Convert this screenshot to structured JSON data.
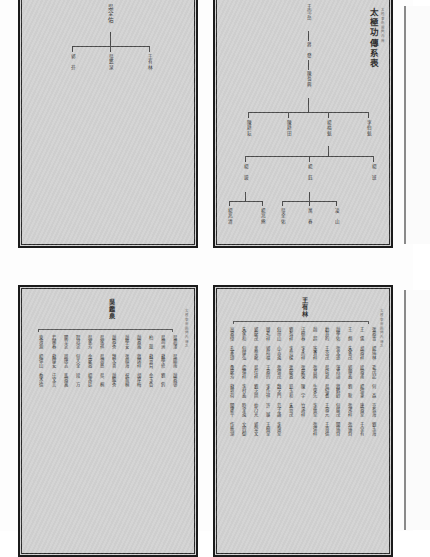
{
  "page": {
    "kind": "scanned-genealogy-book-spread",
    "paper_color": "#d2d2d2",
    "ink_color": "#3a3a3a",
    "background_color": "#fdfdfd"
  },
  "leaves": {
    "top_left": {
      "name": "top-left-leaf",
      "banxin": "",
      "tree": {
        "root": "吳全佑",
        "children": [
          "王有林",
          "吳鑑泉",
          "郭\n芬"
        ]
      }
    },
    "top_right": {
      "name": "top-right-leaf",
      "title": "太極功傳系表",
      "banxin": "太極拳術圖門內傳",
      "generations": [
        {
          "nodes": [
            "王宗岳"
          ]
        },
        {
          "nodes": [
            "蔣　發"
          ]
        },
        {
          "nodes": [
            "陳長興"
          ]
        },
        {
          "nodes": [
            "陳耕耘",
            "陳耕田",
            "楊福魁",
            "李伯魁"
          ]
        },
        {
          "nodes": [
            "楊\n鋑",
            "楊\n鈺",
            "楊\n班"
          ]
        },
        {
          "nodes": [
            "楊兆熊",
            "楊兆清",
            "吳全佑",
            "萬\n春",
            "凌\n山"
          ]
        }
      ]
    },
    "bottom_left": {
      "name": "bottom-left-leaf",
      "heading": "吳鑑泉",
      "banxin": "太極拳術圖門內傳之",
      "columns": [
        [
          "吳潤澤",
          "吳圖南",
          "趙壽邨"
        ],
        [
          "吳潤洲",
          "蘇學修",
          "劉　釣"
        ],
        [
          "柏　琨",
          "蘇景賢",
          "金玉魯"
        ],
        [
          "趙壽嵩",
          "蔣闊祥",
          "胡厚梅"
        ],
        [
          "趙學安",
          "張鍾海",
          "祝留桐"
        ],
        [
          "趙壽秀",
          "魏文喜",
          "趙繼秀"
        ],
        [
          "吳家祺",
          "吳潤慈",
          "吳　桐"
        ],
        [
          "吳家芳",
          "金慶壽",
          "楊禹廷"
        ],
        [
          "程冠忠",
          "何大全",
          "段　方"
        ],
        [
          "關立忠",
          "周唐志",
          "馬壽嵩"
        ],
        [
          "若國春",
          "蘇蔭安",
          "汪文言"
        ],
        [
          "東海源",
          "楊德山",
          "喬木德"
        ]
      ]
    },
    "bottom_right": {
      "name": "bottom-right-leaf",
      "heading": "王有林",
      "banxin": "太極拳術圖門內傳之",
      "columns": [
        [
          "張壽青",
          "楊瑞林",
          "毛茂起",
          "何　森",
          "京長海",
          "劉玉海"
        ],
        [
          "王　儒",
          "胡壽祥",
          "段壽甫",
          "楊德筆",
          "唐壽堂",
          "于卓有"
        ],
        [
          "王　炯",
          "朱家茂",
          "郭順義",
          "劉　耿",
          "張鴻祥",
          "張瑞齊"
        ],
        [
          "趙學佑",
          "張文遂",
          "蓮昌諳",
          "蔣鶴齡",
          "何蔭茂",
          "關瑞齊"
        ],
        [
          "勸其昀",
          "王克茂",
          "吳廷斌",
          "吳紹耆",
          "王壽元",
          "王喜德"
        ],
        [
          "趙　超",
          "遙香祥",
          "張昌興",
          "牛榮先",
          "李振堂",
          "張德祥"
        ],
        [
          "汪樹春",
          "李永祥",
          "張慶榮",
          "陳　宇",
          "竹濤祥",
          ""
        ],
        [
          "劉長祥",
          "李世樑",
          "張慶壽",
          "鉛玉和",
          "朱景茂",
          ""
        ],
        [
          "何崗山",
          "小志遠",
          "張德茂",
          "魏芝門",
          "范子謙",
          "李煥堂"
        ],
        [
          "韓毛祥",
          "郭培福",
          "王壽的",
          "李作祺",
          "許　展",
          "王樹堂"
        ],
        [
          "郭慶茂",
          "黃金龍",
          "吳在祥",
          "劉芝岡",
          "仲乃光",
          "郭受文"
        ],
        [
          "朱家和",
          "何蔭弘",
          "盧福祥",
          "李村義",
          "時全遠",
          "文的御"
        ],
        [
          "高壽偉",
          "孔憲璋",
          "桑慶芳",
          "蘇垣荷",
          "關建平",
          "作振湖"
        ]
      ]
    }
  }
}
